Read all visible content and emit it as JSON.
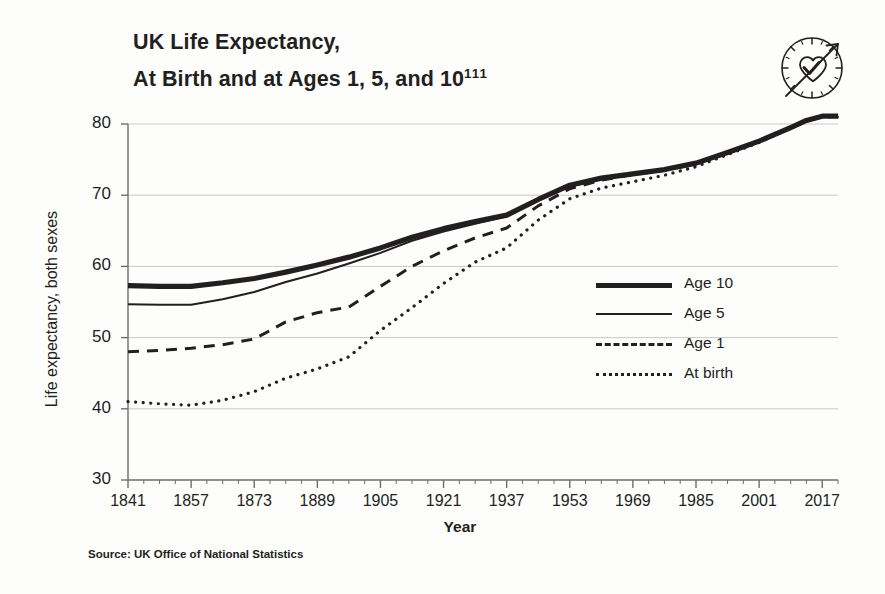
{
  "title": {
    "line1": "UK Life Expectancy,",
    "line2": "At Birth and at Ages 1, 5, and 10",
    "superscript": "111"
  },
  "icon": {
    "name": "heart-clock-arrow-icon"
  },
  "source": "Source: UK Office of National Statistics",
  "legend": {
    "position": "inside-right",
    "items": [
      {
        "key": "age10",
        "label": "Age 10",
        "style": "thick-solid"
      },
      {
        "key": "age5",
        "label": "Age 5",
        "style": "thin-solid"
      },
      {
        "key": "age1",
        "label": "Age 1",
        "style": "dashed"
      },
      {
        "key": "birth",
        "label": "At birth",
        "style": "dotted"
      }
    ]
  },
  "chart_data": {
    "type": "line",
    "title": "UK Life Expectancy, At Birth and at Ages 1, 5, and 10",
    "xlabel": "Year",
    "ylabel": "Life expectancy, both sexes",
    "xlim": [
      1841,
      2021
    ],
    "ylim": [
      30,
      80
    ],
    "xticks": [
      1841,
      1857,
      1873,
      1889,
      1905,
      1921,
      1937,
      1953,
      1969,
      1985,
      2001,
      2017
    ],
    "xminor_step": 4,
    "yticks": [
      30,
      40,
      50,
      60,
      70,
      80
    ],
    "grid": "horizontal",
    "x": [
      1841,
      1849,
      1857,
      1865,
      1873,
      1881,
      1889,
      1897,
      1905,
      1913,
      1921,
      1929,
      1937,
      1945,
      1953,
      1961,
      1969,
      1977,
      1985,
      1993,
      2001,
      2009,
      2013,
      2017,
      2021
    ],
    "series": [
      {
        "name": "Age 10",
        "style": "thick-solid",
        "values": [
          57.3,
          57.2,
          57.2,
          57.7,
          58.3,
          59.2,
          60.2,
          61.3,
          62.6,
          64.1,
          65.3,
          66.3,
          67.2,
          69.4,
          71.4,
          72.4,
          73.0,
          73.6,
          74.5,
          76.0,
          77.6,
          79.5,
          80.5,
          81.1,
          81.1
        ]
      },
      {
        "name": "Age 5",
        "style": "thin-solid",
        "values": [
          54.7,
          54.6,
          54.6,
          55.4,
          56.4,
          57.8,
          59.0,
          60.4,
          61.9,
          63.6,
          64.9,
          66.0,
          67.0,
          69.3,
          71.3,
          72.3,
          73.0,
          73.6,
          74.5,
          76.0,
          77.6,
          79.5,
          80.5,
          81.1,
          81.1
        ]
      },
      {
        "name": "Age 1",
        "style": "dashed",
        "values": [
          48.0,
          48.2,
          48.5,
          49.0,
          49.8,
          52.2,
          53.5,
          54.3,
          57.2,
          60.0,
          62.2,
          64.0,
          65.4,
          68.5,
          70.9,
          72.1,
          72.9,
          73.5,
          74.4,
          76.0,
          77.6,
          79.5,
          80.5,
          81.1,
          81.1
        ]
      },
      {
        "name": "At birth",
        "style": "dotted",
        "values": [
          41.0,
          40.7,
          40.5,
          41.2,
          42.4,
          44.3,
          45.6,
          47.3,
          51.0,
          54.2,
          57.6,
          60.6,
          62.6,
          66.5,
          69.5,
          71.0,
          71.9,
          72.8,
          74.0,
          75.7,
          77.4,
          79.4,
          80.4,
          81.0,
          81.0
        ]
      }
    ]
  }
}
